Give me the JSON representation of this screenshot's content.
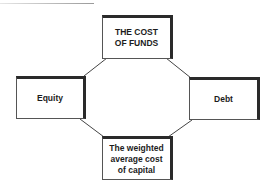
{
  "diagram": {
    "type": "cycle",
    "nodes": [
      {
        "id": "top",
        "label": "THE COST\nOF FUNDS"
      },
      {
        "id": "left",
        "label": "Equity"
      },
      {
        "id": "right",
        "label": "Debt"
      },
      {
        "id": "bottom",
        "label": "The weighted\naverage cost\nof capital"
      }
    ],
    "edges": [
      {
        "from": "top",
        "to": "left"
      },
      {
        "from": "top",
        "to": "right"
      },
      {
        "from": "left",
        "to": "bottom"
      },
      {
        "from": "right",
        "to": "bottom"
      }
    ],
    "colors": {
      "line": "#444444",
      "shadow": "#2a2a2a",
      "text": "#1c1c1c",
      "background": "#ffffff"
    }
  }
}
